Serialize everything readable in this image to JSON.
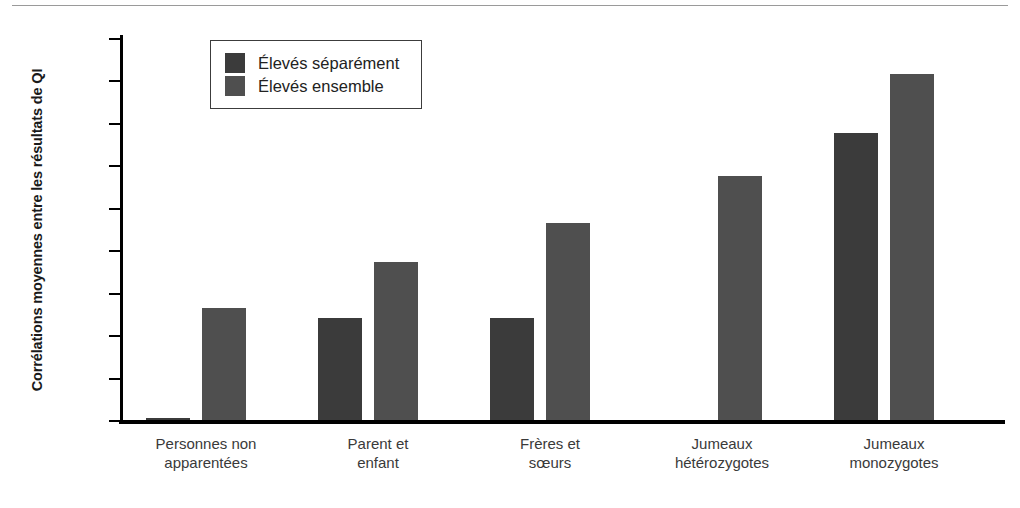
{
  "chart_data": {
    "type": "bar",
    "title": "",
    "xlabel": "",
    "ylabel": "Corrélations moyennes entre les résultats de QI",
    "ylim": [
      0.0,
      0.9
    ],
    "ytick_labels": [
      ",90",
      ",80",
      ",70",
      ",60",
      ",50",
      ",40",
      ",30",
      ",20",
      ",10",
      ",00"
    ],
    "ytick_values": [
      0.9,
      0.8,
      0.7,
      0.6,
      0.5,
      0.4,
      0.3,
      0.2,
      0.1,
      0.0
    ],
    "grid": false,
    "legend_position": "top-left-inside",
    "categories": [
      "Personnes non\napparentées",
      "Parent et\nenfant",
      "Frères et\nsœurs",
      "Jumeaux\nhétérozygotes",
      "Jumeaux\nmonozygotes"
    ],
    "series": [
      {
        "name": "Élevés séparément",
        "color": "#3b3b3b",
        "values": [
          0.005,
          0.24,
          0.24,
          null,
          0.677
        ]
      },
      {
        "name": "Élevés ensemble",
        "color": "#4f4f4f",
        "values": [
          0.265,
          0.373,
          0.465,
          0.575,
          0.815
        ]
      }
    ]
  },
  "legend": {
    "items": [
      {
        "label": "Élevés séparément",
        "swatch": "sep"
      },
      {
        "label": "Élevés ensemble",
        "swatch": "ens"
      }
    ]
  }
}
